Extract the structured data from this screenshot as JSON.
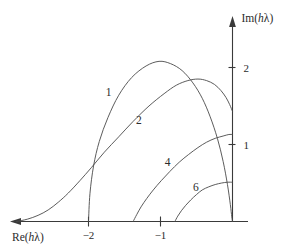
{
  "figure": {
    "width": 284,
    "height": 252,
    "background": "#ffffff",
    "line_color": "#4a4a4a",
    "axis_color": "#3a3a3a",
    "text_color": "#2b2b2b"
  },
  "chart_data": {
    "type": "line",
    "title": "",
    "xlabel": "Re(hλ)",
    "ylabel": "Im(hλ)",
    "xlabel_parts": {
      "prefix": "Re(",
      "italic": "h",
      "lambda": "λ",
      "suffix": ")"
    },
    "ylabel_parts": {
      "prefix": "Im(",
      "italic": "h",
      "lambda": "λ",
      "suffix": ")"
    },
    "grid": false,
    "legend": "inline-curve-labels",
    "xlim": [
      -3.0,
      0.18
    ],
    "ylim": [
      0,
      2.6
    ],
    "xticks": [
      -2,
      -1
    ],
    "xtick_labels": [
      "−2",
      "−1"
    ],
    "yticks": [
      1,
      2
    ],
    "ytick_labels": [
      "1",
      "2"
    ],
    "x_axis_direction": "arrow-left",
    "y_axis_direction": "arrow-up",
    "series": [
      {
        "name": "1",
        "label": "1",
        "label_x": -1.72,
        "label_y": 1.63,
        "points": [
          [
            -2.0,
            0.0
          ],
          [
            -1.98,
            0.36
          ],
          [
            -1.93,
            0.72
          ],
          [
            -1.85,
            1.04
          ],
          [
            -1.73,
            1.35
          ],
          [
            -1.58,
            1.64
          ],
          [
            -1.4,
            1.87
          ],
          [
            -1.2,
            2.02
          ],
          [
            -1.02,
            2.08
          ],
          [
            -0.86,
            2.05
          ],
          [
            -0.7,
            1.96
          ],
          [
            -0.55,
            1.8
          ],
          [
            -0.42,
            1.6
          ],
          [
            -0.31,
            1.36
          ],
          [
            -0.21,
            1.08
          ],
          [
            -0.13,
            0.78
          ],
          [
            -0.07,
            0.48
          ],
          [
            -0.03,
            0.22
          ],
          [
            -0.01,
            0.06
          ],
          [
            0.0,
            0.0
          ]
        ]
      },
      {
        "name": "2",
        "label": "2",
        "label_x": -1.3,
        "label_y": 1.27,
        "points": [
          [
            -3.0,
            0.0
          ],
          [
            -2.85,
            0.03
          ],
          [
            -2.7,
            0.08
          ],
          [
            -2.56,
            0.15
          ],
          [
            -2.42,
            0.25
          ],
          [
            -2.28,
            0.37
          ],
          [
            -2.12,
            0.53
          ],
          [
            -1.96,
            0.7
          ],
          [
            -1.78,
            0.9
          ],
          [
            -1.58,
            1.1
          ],
          [
            -1.38,
            1.3
          ],
          [
            -1.16,
            1.5
          ],
          [
            -0.95,
            1.66
          ],
          [
            -0.78,
            1.77
          ],
          [
            -0.62,
            1.83
          ],
          [
            -0.48,
            1.85
          ],
          [
            -0.36,
            1.83
          ],
          [
            -0.25,
            1.78
          ],
          [
            -0.16,
            1.7
          ],
          [
            -0.09,
            1.61
          ],
          [
            -0.04,
            1.52
          ],
          [
            0.0,
            1.43
          ]
        ]
      },
      {
        "name": "4",
        "label": "4",
        "label_x": -0.9,
        "label_y": 0.72,
        "points": [
          [
            -1.38,
            0.0
          ],
          [
            -1.33,
            0.09
          ],
          [
            -1.27,
            0.19
          ],
          [
            -1.19,
            0.3
          ],
          [
            -1.1,
            0.41
          ],
          [
            -0.99,
            0.53
          ],
          [
            -0.87,
            0.65
          ],
          [
            -0.74,
            0.77
          ],
          [
            -0.61,
            0.87
          ],
          [
            -0.48,
            0.96
          ],
          [
            -0.36,
            1.03
          ],
          [
            -0.24,
            1.08
          ],
          [
            -0.13,
            1.11
          ],
          [
            -0.05,
            1.13
          ],
          [
            0.0,
            1.13
          ]
        ]
      },
      {
        "name": "6",
        "label": "6",
        "label_x": -0.51,
        "label_y": 0.4,
        "points": [
          [
            -0.8,
            0.0
          ],
          [
            -0.76,
            0.07
          ],
          [
            -0.71,
            0.14
          ],
          [
            -0.65,
            0.21
          ],
          [
            -0.58,
            0.28
          ],
          [
            -0.5,
            0.35
          ],
          [
            -0.42,
            0.41
          ],
          [
            -0.33,
            0.45
          ],
          [
            -0.24,
            0.48
          ],
          [
            -0.15,
            0.5
          ],
          [
            -0.07,
            0.51
          ],
          [
            0.0,
            0.51
          ]
        ]
      }
    ]
  }
}
